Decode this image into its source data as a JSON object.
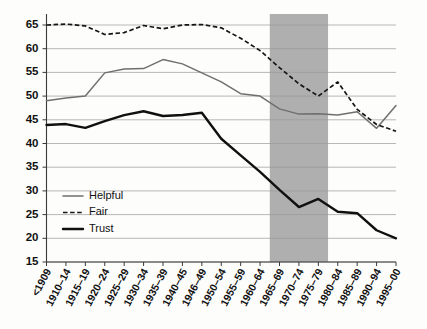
{
  "chart_data": {
    "type": "line",
    "title": "",
    "subtitle": "",
    "xlabel": "",
    "ylabel": "",
    "ylim": [
      15,
      65
    ],
    "yticks": [
      15,
      20,
      25,
      30,
      35,
      40,
      45,
      50,
      55,
      60,
      65
    ],
    "grid": true,
    "legend_position": "inside-lower-left",
    "categories": [
      "<1909",
      "1910–14",
      "1915–19",
      "1920–24",
      "1925–29",
      "1930–34",
      "1935–39",
      "1940–45",
      "1946–49",
      "1950–54",
      "1955–59",
      "1960–64",
      "1965–69",
      "1970–74",
      "1975–79",
      "1980–84",
      "1985–89",
      "1990–94",
      "1995–00"
    ],
    "series": [
      {
        "name": "Helpful",
        "style": "solid",
        "color": "#6f6f6f",
        "values": [
          49.0,
          49.6,
          50.0,
          54.9,
          55.7,
          55.8,
          57.7,
          56.8,
          54.9,
          53.0,
          50.5,
          50.0,
          47.3,
          46.2,
          46.3,
          46.0,
          46.7,
          43.2,
          48.0
        ]
      },
      {
        "name": "Fair",
        "style": "dashed",
        "color": "#151515",
        "values": [
          65.0,
          65.2,
          64.8,
          63.0,
          63.4,
          64.9,
          64.2,
          65.0,
          65.1,
          64.4,
          62.2,
          59.6,
          56.0,
          52.6,
          50.0,
          53.0,
          47.2,
          44.0,
          42.6
        ]
      },
      {
        "name": "Trust",
        "style": "solid-thick",
        "color": "#101010",
        "values": [
          43.9,
          44.1,
          43.3,
          44.7,
          46.0,
          46.8,
          45.8,
          46.0,
          46.5,
          41.0,
          37.5,
          34.0,
          30.2,
          26.6,
          28.3,
          25.6,
          25.3,
          21.7,
          20.0
        ]
      }
    ],
    "highlight_band": {
      "from_category": "1965–69",
      "to_category": "1975–79",
      "color": "#a8a8a8"
    }
  },
  "legend": {
    "items": [
      {
        "label": "Helpful",
        "style": "solid",
        "color": "#6f6f6f"
      },
      {
        "label": "Fair",
        "style": "dashed",
        "color": "#151515"
      },
      {
        "label": "Trust",
        "style": "solid-thick",
        "color": "#101010"
      }
    ]
  }
}
